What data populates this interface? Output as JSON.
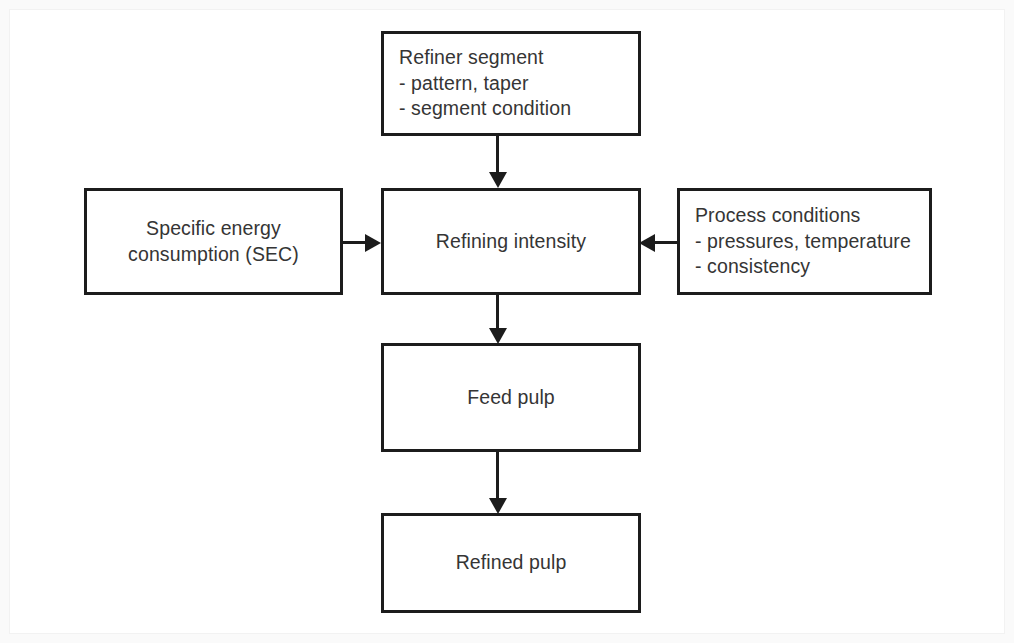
{
  "diagram": {
    "type": "flowchart",
    "background_color": "#ffffff",
    "line_color": "#1c1c1c",
    "text_color": "#353535",
    "nodes": [
      {
        "id": "refiner_segment",
        "title": "Refiner segment",
        "bullet_1": "- pattern, taper",
        "bullet_2": "- segment condition",
        "align": "left"
      },
      {
        "id": "specific_energy",
        "line_1": "Specific energy",
        "line_2": "consumption (SEC)",
        "align": "center"
      },
      {
        "id": "refining_intensity",
        "label": "Refining intensity",
        "align": "center"
      },
      {
        "id": "process_conditions",
        "title": "Process conditions",
        "bullet_1": "- pressures, temperature",
        "bullet_2": "- consistency",
        "align": "left"
      },
      {
        "id": "feed_pulp",
        "label": "Feed pulp",
        "align": "center"
      },
      {
        "id": "refined_pulp",
        "label": "Refined pulp",
        "align": "center"
      }
    ],
    "connectors": [
      {
        "id": "segment_to_intensity",
        "from": "refiner_segment",
        "to": "refining_intensity",
        "direction": "down"
      },
      {
        "id": "sec_to_intensity",
        "from": "specific_energy",
        "to": "refining_intensity",
        "direction": "right"
      },
      {
        "id": "process_to_intensity",
        "from": "process_conditions",
        "to": "refining_intensity",
        "direction": "left"
      },
      {
        "id": "intensity_to_feed",
        "from": "refining_intensity",
        "to": "feed_pulp",
        "direction": "down"
      },
      {
        "id": "feed_to_refined",
        "from": "feed_pulp",
        "to": "refined_pulp",
        "direction": "down"
      }
    ]
  }
}
